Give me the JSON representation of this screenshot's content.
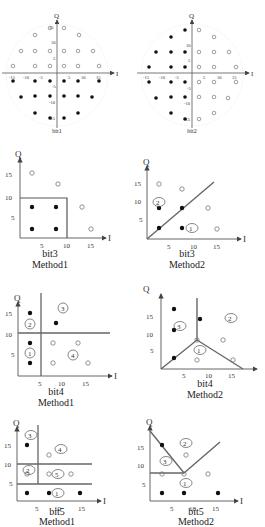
{
  "figure": {
    "panels": [
      {
        "id": "top-left",
        "caption": "bit1",
        "xlabel": "I",
        "ylabel": "Q",
        "xticks": [
          "-15",
          "-10",
          "-5",
          "5",
          "10",
          "15"
        ],
        "yticks": [
          "15",
          "10",
          "5",
          "-5",
          "-10",
          "-15"
        ]
      },
      {
        "id": "top-right",
        "caption": "bit2",
        "xlabel": "I",
        "ylabel": "Q",
        "xticks": [
          "-15",
          "-10",
          "-5",
          "5",
          "10",
          "15"
        ],
        "yticks": [
          "15",
          "10",
          "5",
          "-5",
          "-10",
          "-15"
        ]
      },
      {
        "id": "row2-left",
        "caption": "bit3",
        "method": "Method1",
        "xlabel": "I",
        "ylabel": "Q",
        "xticks": [
          "5",
          "10",
          "15"
        ],
        "yticks": [
          "5",
          "10",
          "15"
        ]
      },
      {
        "id": "row2-right",
        "caption": "bit3",
        "method": "Method2",
        "xlabel": "I",
        "ylabel": "Q",
        "xticks": [
          "5",
          "10",
          "15"
        ],
        "yticks": [
          "5",
          "10",
          "15"
        ],
        "regions": [
          "1",
          "2"
        ]
      },
      {
        "id": "row3-left",
        "caption": "bit4",
        "method": "Method1",
        "xlabel": "I",
        "ylabel": "Q",
        "xticks": [
          "5",
          "10",
          "15"
        ],
        "yticks": [
          "5",
          "10",
          "15"
        ],
        "regions": [
          "1",
          "2",
          "3",
          "4"
        ]
      },
      {
        "id": "row3-right",
        "caption": "bit4",
        "method": "Method2",
        "xlabel": "I",
        "ylabel": "Q",
        "xticks": [
          "5",
          "10",
          "15"
        ],
        "yticks": [
          "5",
          "10",
          "15"
        ],
        "regions": [
          "1",
          "2",
          "3"
        ]
      },
      {
        "id": "row4-left",
        "caption": "bit5",
        "method": "Method1",
        "xlabel": "I",
        "ylabel": "Q",
        "xticks": [
          "5",
          "10",
          "15"
        ],
        "yticks": [
          "5",
          "10",
          "15"
        ],
        "regions": [
          "1",
          "2",
          "3",
          "4",
          "5"
        ]
      },
      {
        "id": "row4-right",
        "caption": "bit5",
        "method": "Method2",
        "xlabel": "I",
        "ylabel": "Q",
        "xticks": [
          "5",
          "10",
          "15"
        ],
        "yticks": [
          "5",
          "10",
          "15"
        ],
        "regions": [
          "1",
          "2",
          "3"
        ]
      }
    ]
  },
  "colors": {
    "axis": "#555555",
    "boundary": "#666666",
    "filled": "#111111",
    "hollow": "#777777"
  }
}
